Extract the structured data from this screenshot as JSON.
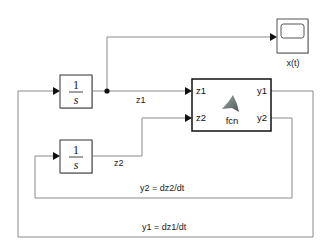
{
  "diagram": {
    "integrator1": {
      "numerator": "1",
      "denominator": "s"
    },
    "integrator2": {
      "numerator": "1",
      "denominator": "s"
    },
    "fcn_block": {
      "name": "fcn",
      "inputs": [
        "z1",
        "z2"
      ],
      "outputs": [
        "y1",
        "y2"
      ]
    },
    "scope": {
      "label": "x(t)"
    },
    "signals": {
      "z1": "z1",
      "z2": "z2",
      "y1": "y1 = dz1/dt",
      "y2": "y2 = dz2/dt"
    },
    "colors": {
      "wire": "#8a8a8a",
      "block_border": "#111111",
      "shadow": "#c8c8c8"
    }
  }
}
